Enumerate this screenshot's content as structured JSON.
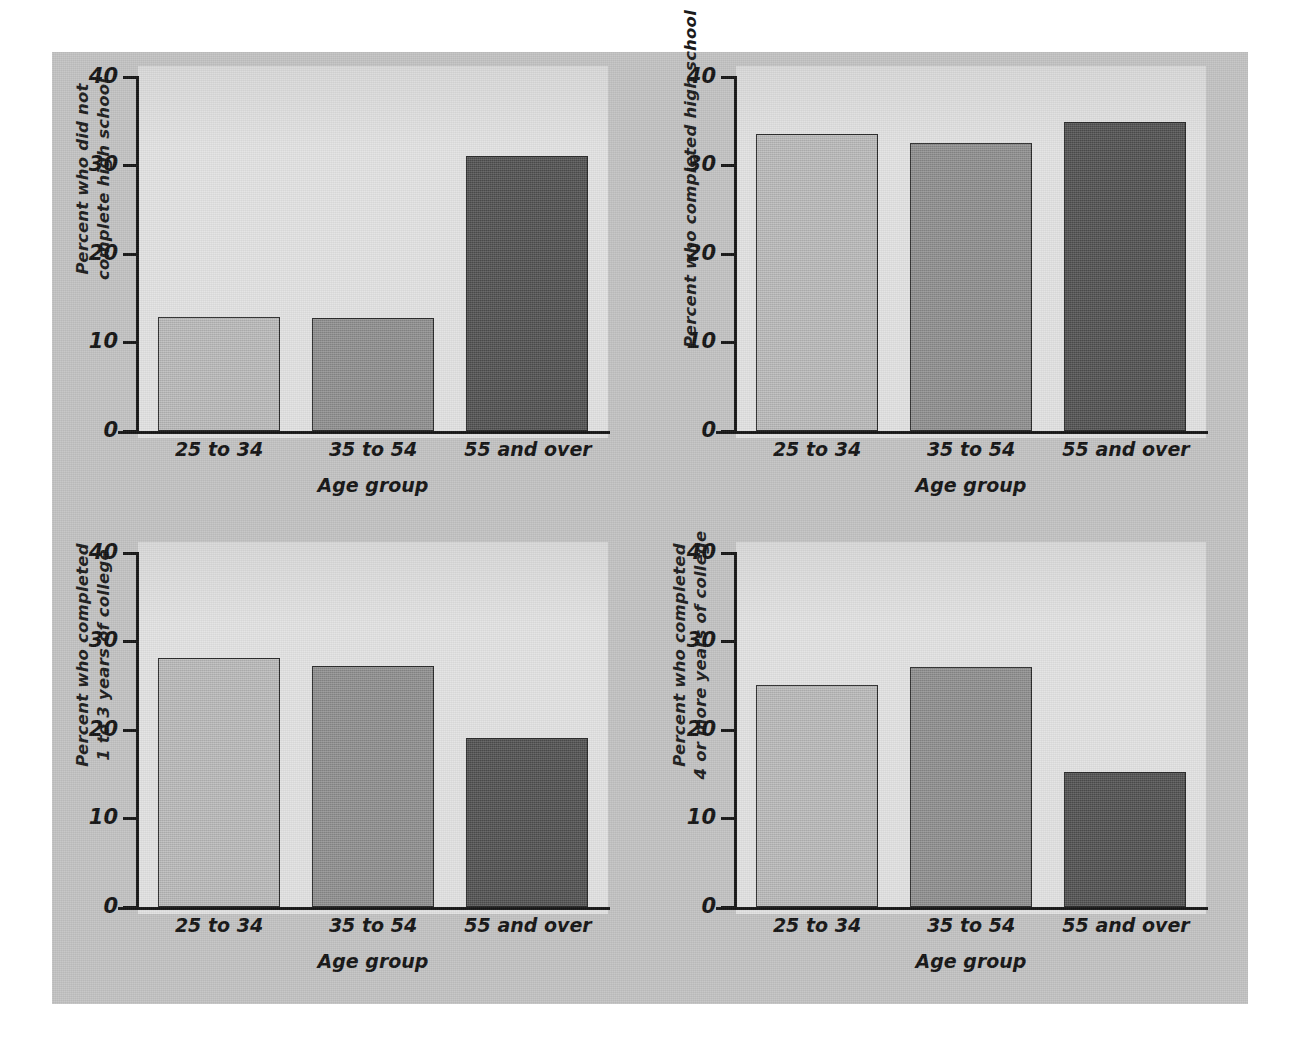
{
  "page": {
    "background_color": "#c3c3c3",
    "outer_background_color": "#ffffff",
    "plot_background_color": "#dedede"
  },
  "series_colors": {
    "25 to 34": "#bdbdbd",
    "35 to 54": "#8d8d8d",
    "55 and over": "#4b4b4b"
  },
  "chart_data": [
    {
      "type": "bar",
      "id": "did-not-complete-high-school",
      "title": "",
      "xlabel": "Age group",
      "ylabel": "Percent who did not complete high school",
      "ylabel_lines": [
        "Percent who did not",
        "complete high school"
      ],
      "categories": [
        "25 to 34",
        "35 to 54",
        "55 and over"
      ],
      "values": [
        12.8,
        12.7,
        31.0
      ],
      "ylim": [
        0,
        40
      ],
      "yticks": [
        0,
        10,
        20,
        30,
        40
      ],
      "ytick_labels": [
        "0",
        "10",
        "20",
        "30",
        "40"
      ],
      "grid": false,
      "legend": "none"
    },
    {
      "type": "bar",
      "id": "completed-high-school",
      "title": "",
      "xlabel": "Age group",
      "ylabel": "Percent who completed high school",
      "ylabel_lines": [
        "Percent who completed high school"
      ],
      "categories": [
        "25 to 34",
        "35 to 54",
        "55 and over"
      ],
      "values": [
        33.5,
        32.5,
        34.8
      ],
      "ylim": [
        0,
        40
      ],
      "yticks": [
        0,
        10,
        20,
        30,
        40
      ],
      "ytick_labels": [
        "0",
        "10",
        "20",
        "30",
        "40"
      ],
      "grid": false,
      "legend": "none"
    },
    {
      "type": "bar",
      "id": "completed-1-to-3-years-college",
      "title": "",
      "xlabel": "Age group",
      "ylabel": "Percent who completed 1 to 3 years of college",
      "ylabel_lines": [
        "Percent who completed",
        "1 to 3 years of college"
      ],
      "categories": [
        "25 to 34",
        "35 to 54",
        "55 and over"
      ],
      "values": [
        28.1,
        27.2,
        19.0
      ],
      "ylim": [
        0,
        40
      ],
      "yticks": [
        0,
        10,
        20,
        30,
        40
      ],
      "ytick_labels": [
        "0",
        "10",
        "20",
        "30",
        "40"
      ],
      "grid": false,
      "legend": "none"
    },
    {
      "type": "bar",
      "id": "completed-4-or-more-years-college",
      "title": "",
      "xlabel": "Age group",
      "ylabel": "Percent who completed 4 or more years of college",
      "ylabel_lines": [
        "Percent who completed",
        "4 or more years of college"
      ],
      "categories": [
        "25 to 34",
        "35 to 54",
        "55 and over"
      ],
      "values": [
        25.0,
        27.1,
        15.2
      ],
      "ylim": [
        0,
        40
      ],
      "yticks": [
        0,
        10,
        20,
        30,
        40
      ],
      "ytick_labels": [
        "0",
        "10",
        "20",
        "30",
        "40"
      ],
      "grid": false,
      "legend": "none"
    }
  ]
}
